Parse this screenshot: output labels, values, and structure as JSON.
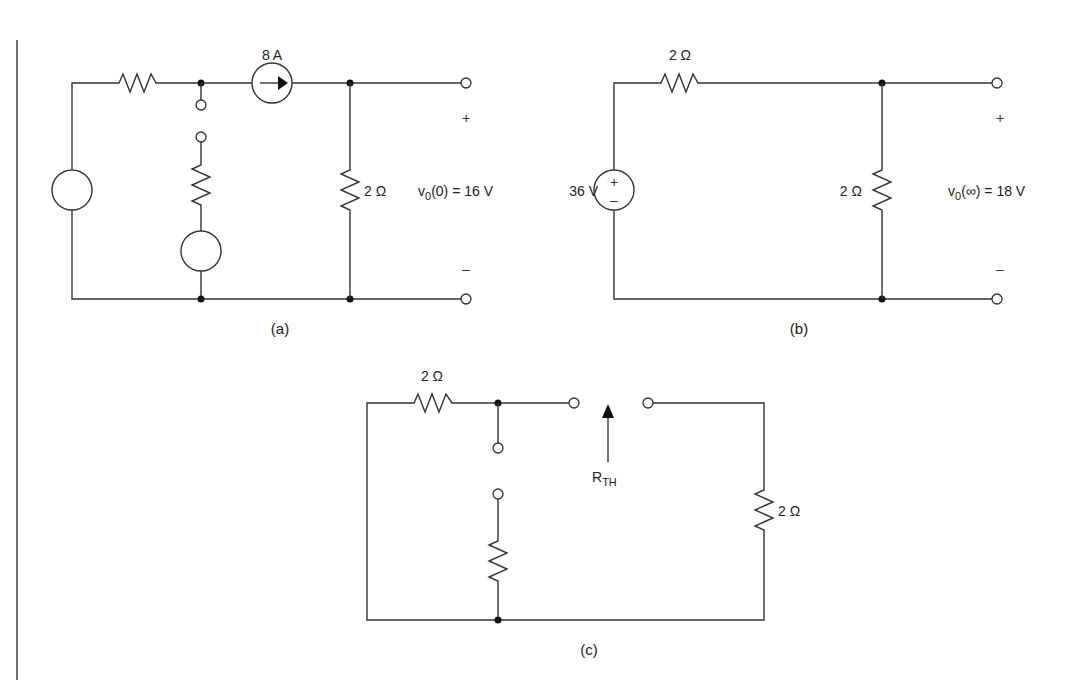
{
  "figure": {
    "panels": [
      {
        "id": "a",
        "caption": "(a)",
        "current_source_label": "8 A",
        "load_resistor_label": "2 Ω",
        "output_label_main": "v",
        "output_label_sub": "0",
        "output_label_rest": "(0) = 16 V",
        "plus": "+",
        "minus": "–"
      },
      {
        "id": "b",
        "caption": "(b)",
        "source_label": "36 V",
        "source_plus": "+",
        "source_minus": "–",
        "series_resistor_label": "2 Ω",
        "load_resistor_label": "2 Ω",
        "output_label_main": "v",
        "output_label_sub": "0",
        "output_label_rest": "(∞) = 18 V",
        "plus": "+",
        "minus": "–"
      },
      {
        "id": "c",
        "caption": "(c)",
        "series_resistor_label": "2 Ω",
        "load_resistor_label": "2 Ω",
        "rth_main": "R",
        "rth_sub": "TH"
      }
    ]
  }
}
